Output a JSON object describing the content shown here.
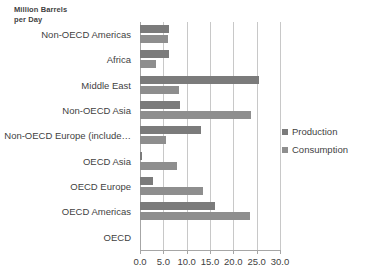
{
  "chart_data": {
    "type": "bar",
    "orientation": "horizontal",
    "title": "",
    "axis_note": "Million Barrels\nper Day",
    "xlabel": "",
    "ylabel": "",
    "xlim": [
      0.0,
      30.0
    ],
    "xticks": [
      "0.0",
      "5.0",
      "10.0",
      "15.0",
      "20.0",
      "25.0",
      "30.0"
    ],
    "xtick_values": [
      0,
      5,
      10,
      15,
      20,
      25,
      30
    ],
    "grid": true,
    "legend_position": "right",
    "categories": [
      "Non-OECD Americas",
      "Africa",
      "Middle East",
      "Non-OECD Asia",
      "Non-OECD Europe (include…",
      "OECD Asia",
      "OECD Europe",
      "OECD Americas",
      "OECD"
    ],
    "series": [
      {
        "name": "Production",
        "color": "#7b7b7b",
        "values": [
          6.3,
          6.2,
          25.5,
          8.5,
          13.0,
          0.5,
          2.8,
          16.0,
          0.0
        ]
      },
      {
        "name": "Consumption",
        "color": "#8e8e8e",
        "values": [
          6.0,
          3.5,
          8.3,
          23.8,
          5.5,
          8.0,
          13.5,
          23.5,
          0.0
        ]
      }
    ]
  },
  "legend": {
    "items": [
      {
        "label": "Production",
        "color": "#7b7b7b"
      },
      {
        "label": "Consumption",
        "color": "#8e8e8e"
      }
    ]
  }
}
